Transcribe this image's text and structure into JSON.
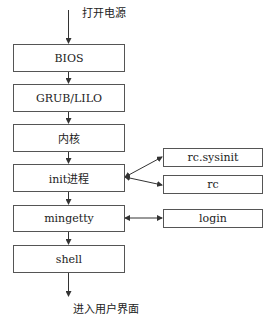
{
  "diagram": {
    "start_label": "打开电源",
    "end_label": "进入用户界面",
    "main_flow": [
      {
        "id": "bios",
        "label": "BIOS"
      },
      {
        "id": "grub",
        "label": "GRUB/LILO"
      },
      {
        "id": "kernel",
        "label": "内核"
      },
      {
        "id": "init",
        "label": "init进程"
      },
      {
        "id": "mingetty",
        "label": "mingetty"
      },
      {
        "id": "shell",
        "label": "shell"
      }
    ],
    "side_nodes": [
      {
        "id": "rcsysinit",
        "label": "rc.sysinit",
        "linked_to": "init"
      },
      {
        "id": "rc",
        "label": "rc",
        "linked_to": "init"
      },
      {
        "id": "login",
        "label": "login",
        "linked_to": "mingetty"
      }
    ]
  }
}
